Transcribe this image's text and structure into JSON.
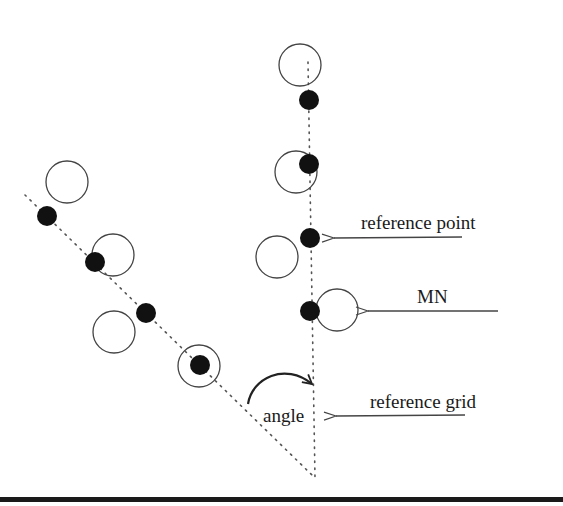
{
  "figure": {
    "labels": {
      "reference_point": "reference point",
      "mn": "MN",
      "reference_grid": "reference grid",
      "angle": "angle"
    },
    "legend_items": [
      {
        "key": "reference_point",
        "symbol": "filled-dot"
      },
      {
        "key": "mn",
        "symbol": "open-circle"
      },
      {
        "key": "reference_grid",
        "symbol": "dotted-line"
      }
    ],
    "colors": {
      "background": "#ffffff",
      "ink": "#111111",
      "line": "#444444"
    }
  }
}
